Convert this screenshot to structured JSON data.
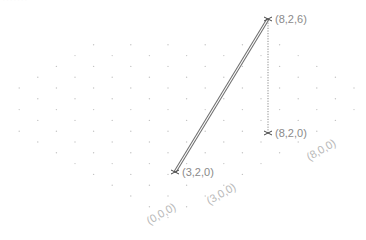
{
  "diagram": {
    "type": "isometric-3d-plot",
    "top_clipped_text": "·······",
    "points": [
      {
        "id": "p1",
        "label": "(3,2,0)",
        "coords": [
          3,
          2,
          0
        ],
        "px": [
          175,
          172
        ]
      },
      {
        "id": "p2",
        "label": "(8,2,6)",
        "coords": [
          8,
          2,
          6
        ],
        "px": [
          268,
          19
        ]
      },
      {
        "id": "p3",
        "label": "(8,2,0)",
        "coords": [
          8,
          2,
          0
        ],
        "px": [
          268,
          133
        ]
      }
    ],
    "segments": [
      {
        "from": "(3,2,0)",
        "to": "(8,2,6)",
        "style": "double-line"
      },
      {
        "from": "(8,2,6)",
        "to": "(8,2,0)",
        "style": "dotted"
      }
    ],
    "axis_labels": [
      {
        "label": "(0,0,0)",
        "px": [
          163,
          217
        ]
      },
      {
        "label": "(3,0,0)",
        "px": [
          223,
          197
        ]
      },
      {
        "label": "(8,0,0)",
        "px": [
          323,
          153
        ]
      }
    ],
    "colors": {
      "line": "#6f6f6f",
      "grid_dot": "#c4c4c4",
      "label": "#8a8a8a",
      "axis_label": "#b8b8b8",
      "background": "#ffffff"
    }
  }
}
